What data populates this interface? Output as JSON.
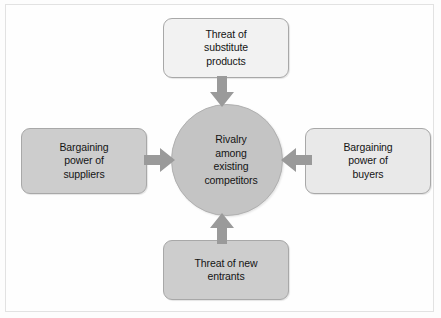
{
  "diagram": {
    "center": {
      "label": "Rivalry among existing competitors",
      "lines": [
        "Rivalry",
        "among",
        "existing",
        "competitors"
      ],
      "fill_color": "#c4c4c4"
    },
    "forces": {
      "top": {
        "label": "Threat of substitute products",
        "lines": [
          "Threat of",
          "substitute",
          "products"
        ],
        "fill_color": "#f2f2f2"
      },
      "left": {
        "label": "Bargaining power of suppliers",
        "lines": [
          "Bargaining",
          "power of",
          "suppliers"
        ],
        "fill_color": "#cdcdcd"
      },
      "right": {
        "label": "Bargaining power of buyers",
        "lines": [
          "Bargaining",
          "power of",
          "buyers"
        ],
        "fill_color": "#e9e9e9"
      },
      "bottom": {
        "label": "Threat of new entrants",
        "lines": [
          "Threat of new",
          "entrants"
        ],
        "fill_color": "#cdcdcd"
      }
    },
    "arrows": {
      "color": "#9a9a9a",
      "top": "arrow-down-icon",
      "left": "arrow-right-icon",
      "right": "arrow-left-icon",
      "bottom": "arrow-up-icon"
    },
    "background_color": "#fdfdfd",
    "text_color": "#141414"
  }
}
